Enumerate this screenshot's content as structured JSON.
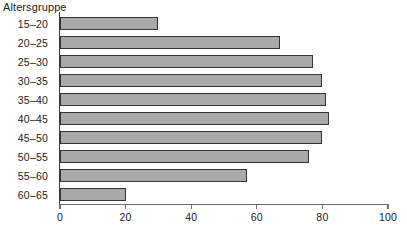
{
  "chart_data": {
    "type": "bar",
    "orientation": "horizontal",
    "title": "",
    "ylabel": "Altersgruppe",
    "xlabel": "",
    "categories": [
      "15–20",
      "20–25",
      "25–30",
      "30–35",
      "35–40",
      "40–45",
      "45–50",
      "50–55",
      "55–60",
      "60–65"
    ],
    "values": [
      30,
      67,
      77,
      80,
      81,
      82,
      80,
      76,
      57,
      20
    ],
    "xlim": [
      0,
      100
    ],
    "xticks": [
      0,
      20,
      40,
      60,
      80,
      100
    ],
    "xtick_labels": [
      "0",
      "20",
      "40",
      "60",
      "80",
      "100"
    ],
    "grid": false,
    "legend": null,
    "bar_color": "#a9a9a9",
    "bar_edge_color": "#333333",
    "axis_color": "#3a3a3a"
  }
}
